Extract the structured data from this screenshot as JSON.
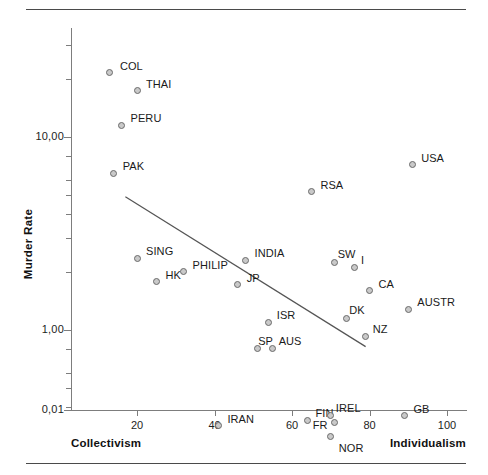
{
  "figure": {
    "clipped_header_text": "",
    "rules": [
      "top-rule",
      "bottom-rule"
    ]
  },
  "chart_data": {
    "type": "scatter",
    "title": "",
    "xlabel": "",
    "ylabel": "Murder Rate",
    "x_axis_left_label": "Collectivism",
    "x_axis_right_label": "Individualism",
    "yscale": "log",
    "xlim": [
      8,
      103
    ],
    "ylim": [
      0.01,
      40
    ],
    "xticks": [
      20,
      40,
      60,
      80,
      100
    ],
    "xticklabels": [
      "20",
      "40",
      "60",
      "80",
      "100"
    ],
    "yticks": [
      10,
      1,
      0.1,
      0.01
    ],
    "yticklabels": [
      "10,00",
      "1,00",
      "0,10",
      "0,01"
    ],
    "grid": false,
    "legend": null,
    "decimal_separator": "comma",
    "trendline": {
      "type": "linear-fit-on-log-y",
      "x_start": 17,
      "y_start": 4.9,
      "x_end": 79,
      "y_end": 0.82
    },
    "points": [
      {
        "label": "COL",
        "x": 13,
        "y": 21.5,
        "label_dx": 10,
        "label_dy": -13
      },
      {
        "label": "THAI",
        "x": 20,
        "y": 17.5,
        "label_dx": 9,
        "label_dy": -12
      },
      {
        "label": "PERU",
        "x": 16,
        "y": 11.5,
        "label_dx": 9,
        "label_dy": -13
      },
      {
        "label": "PAK",
        "x": 14,
        "y": 6.5,
        "label_dx": 9,
        "label_dy": -13
      },
      {
        "label": "USA",
        "x": 91,
        "y": 7.2,
        "label_dx": 9,
        "label_dy": -13
      },
      {
        "label": "RSA",
        "x": 65,
        "y": 5.2,
        "label_dx": 9,
        "label_dy": -13
      },
      {
        "label": "SING",
        "x": 20,
        "y": 2.35,
        "label_dx": 9,
        "label_dy": -13
      },
      {
        "label": "HK",
        "x": 25,
        "y": 1.78,
        "label_dx": 9,
        "label_dy": -13
      },
      {
        "label": "PHILIP",
        "x": 32,
        "y": 2.0,
        "label_dx": 9,
        "label_dy": -13
      },
      {
        "label": "INDIA",
        "x": 48,
        "y": 2.3,
        "label_dx": 9,
        "label_dy": -13
      },
      {
        "label": "JP",
        "x": 46,
        "y": 1.72,
        "label_dx": 9,
        "label_dy": -13
      },
      {
        "label": "SW",
        "x": 71,
        "y": 2.25,
        "label_dx": 3,
        "label_dy": -14
      },
      {
        "label": "I",
        "x": 76,
        "y": 2.1,
        "label_dx": 7,
        "label_dy": -14
      },
      {
        "label": "CA",
        "x": 80,
        "y": 1.6,
        "label_dx": 9,
        "label_dy": -13
      },
      {
        "label": "AUSTR",
        "x": 90,
        "y": 1.28,
        "label_dx": 9,
        "label_dy": -13
      },
      {
        "label": "ISR",
        "x": 54,
        "y": 1.1,
        "label_dx": 8,
        "label_dy": -13
      },
      {
        "label": "DK",
        "x": 74,
        "y": 1.15,
        "label_dx": 3,
        "label_dy": -14
      },
      {
        "label": "NZ",
        "x": 79,
        "y": 0.92,
        "label_dx": 7,
        "label_dy": -14
      },
      {
        "label": "SP",
        "x": 51,
        "y": 0.8,
        "label_dx": 1,
        "label_dy": -14
      },
      {
        "label": "AUS",
        "x": 55,
        "y": 0.8,
        "label_dx": 6,
        "label_dy": -14
      },
      {
        "label": "IRAN",
        "x": 41,
        "y": 0.32,
        "label_dx": 9,
        "label_dy": -13
      },
      {
        "label": "FIN",
        "x": 64,
        "y": 0.34,
        "label_dx": 8,
        "label_dy": -13
      },
      {
        "label": "IREL",
        "x": 70,
        "y": 0.36,
        "label_dx": 5,
        "label_dy": -14
      },
      {
        "label": "FR",
        "x": 71,
        "y": 0.33,
        "label_dx": -22,
        "label_dy": -4
      },
      {
        "label": "NOR",
        "x": 70,
        "y": 0.28,
        "label_dx": 8,
        "label_dy": 5
      },
      {
        "label": "GB",
        "x": 89,
        "y": 0.36,
        "label_dx": 9,
        "label_dy": -13
      }
    ]
  }
}
